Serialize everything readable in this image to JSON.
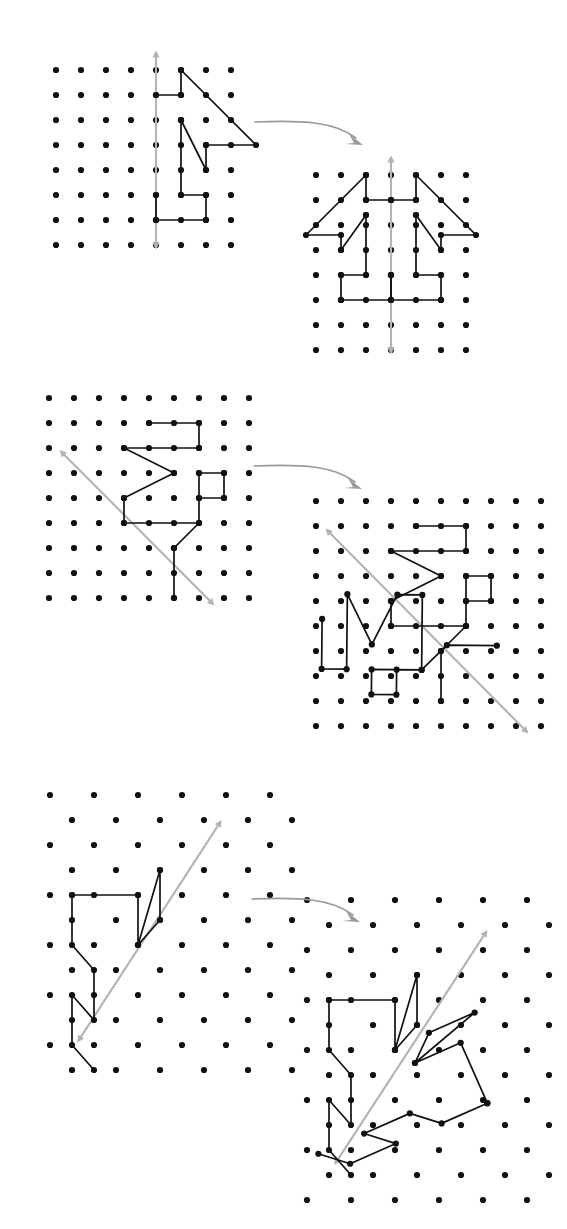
{
  "figure": {
    "background_color": "#ffffff",
    "dot_color": "#111111",
    "path_color": "#111111",
    "mirror_color": "#b3b3b3",
    "connector_color": "#9a9a9a",
    "dot_radius": 3.1,
    "vertex_radius": 3.1,
    "rows": [
      {
        "id": "row-1",
        "label": "Vertical mirror on a square lattice",
        "left": {
          "id": "panel-1-original",
          "lattice_type": "square",
          "cols": 8,
          "rows": 8,
          "spacing": 25,
          "origin": [
            56,
            70
          ],
          "mirror": {
            "type": "vertical",
            "from": [
              4,
              -0.75
            ],
            "to": [
              4,
              7.1
            ],
            "arrows": "both"
          },
          "path": [
            [
              4,
              0
            ],
            [
              5,
              0
            ],
            [
              5,
              1
            ],
            [
              4,
              1
            ],
            [
              5,
              1
            ],
            [
              5,
              0
            ],
            [
              8,
              3
            ],
            [
              6,
              3
            ],
            [
              6,
              4
            ],
            [
              5,
              4
            ],
            [
              5,
              2
            ],
            [
              5,
              5
            ],
            [
              6,
              5
            ],
            [
              6,
              6
            ],
            [
              4,
              6
            ],
            [
              4,
              5
            ],
            [
              5,
              5
            ],
            [
              5,
              4
            ]
          ],
          "path_segments": [
            [
              [
                4,
                1
              ],
              [
                5,
                1
              ],
              [
                5,
                0
              ],
              [
                8,
                3
              ],
              [
                6,
                3
              ],
              [
                6,
                4
              ],
              [
                5,
                2
              ]
            ],
            [
              [
                5,
                2
              ],
              [
                5,
                5
              ],
              [
                6,
                5
              ],
              [
                6,
                6
              ],
              [
                4,
                6
              ],
              [
                4,
                5
              ]
            ],
            [
              [
                5,
                0
              ],
              [
                5,
                1
              ]
            ]
          ]
        },
        "right": {
          "id": "panel-1-reflected",
          "lattice_type": "square",
          "cols": 7,
          "rows": 8,
          "spacing": 25,
          "origin": [
            316,
            175
          ],
          "mirror": {
            "type": "vertical",
            "from": [
              3,
              -0.75
            ],
            "to": [
              3,
              7.1
            ],
            "arrows": "both"
          }
        }
      },
      {
        "id": "row-2",
        "label": "Diagonal mirror on a square lattice",
        "left": {
          "id": "panel-2-original",
          "lattice_type": "square",
          "cols": 9,
          "rows": 9,
          "spacing": 25,
          "origin": [
            49,
            398
          ],
          "mirror": {
            "type": "diagonal",
            "from": [
              0.45,
              2.1
            ],
            "to": [
              6.6,
              8.3
            ],
            "arrows": "both"
          }
        },
        "right": {
          "id": "panel-2-reflected",
          "lattice_type": "square",
          "cols": 10,
          "rows": 10,
          "spacing": 25,
          "origin": [
            318,
            503
          ],
          "mirror": {
            "type": "diagonal",
            "from": [
              0.4,
              1.1
            ],
            "to": [
              8.5,
              9.3
            ],
            "arrows": "both"
          }
        }
      },
      {
        "id": "row-3",
        "label": "Diagonal mirror on a triangular lattice",
        "left": {
          "id": "panel-3-original",
          "lattice_type": "triangular",
          "cols": 6,
          "rows": 12,
          "spacing_x": 44,
          "spacing_y": 25,
          "origin": [
            53,
            795
          ],
          "mirror": {
            "type": "diagonal",
            "from": [
              0.95,
              9.7
            ],
            "to": [
              4.2,
              1.15
            ],
            "arrows": "both"
          }
        },
        "right": {
          "id": "panel-3-reflected",
          "lattice_type": "triangular",
          "cols": 7,
          "rows": 13,
          "spacing_x": 44,
          "spacing_y": 25,
          "origin": [
            310,
            900
          ],
          "mirror": {
            "type": "diagonal",
            "from": [
              0.95,
              10.4
            ],
            "to": [
              4.4,
              1.15
            ],
            "arrows": "both"
          }
        }
      }
    ],
    "connectors": [
      {
        "id": "connector-1",
        "from": [
          259,
          118
        ],
        "to": [
          364,
          135
        ]
      },
      {
        "id": "connector-2",
        "from": [
          258,
          462
        ],
        "to": [
          363,
          479
        ]
      },
      {
        "id": "connector-3",
        "from": [
          256,
          895
        ],
        "to": [
          361,
          912
        ]
      }
    ]
  },
  "chart_data": {
    "type": "diagram",
    "subtype": "lattice-reflection",
    "panels": [
      {
        "name": "row1-left",
        "lattice": "square-8x8",
        "mirror_axis": "vertical at column 4",
        "polyline_vertices": [
          [
            4,
            1
          ],
          [
            5,
            1
          ],
          [
            5,
            0
          ],
          [
            8,
            3
          ],
          [
            6,
            3
          ],
          [
            6,
            4
          ],
          [
            5,
            2
          ],
          [
            5,
            5
          ],
          [
            6,
            5
          ],
          [
            6,
            6
          ],
          [
            4,
            6
          ],
          [
            4,
            5
          ]
        ]
      },
      {
        "name": "row1-right",
        "lattice": "square-7x8",
        "mirror_axis": "vertical at column 3",
        "note": "original plus its mirror image"
      },
      {
        "name": "row2-left",
        "lattice": "square-9x9",
        "mirror_axis": "diagonal, down-right slope 1",
        "polyline_vertices": [
          [
            4,
            1
          ],
          [
            6,
            1
          ],
          [
            6,
            2
          ],
          [
            3,
            2
          ],
          [
            5,
            3
          ],
          [
            3,
            4
          ],
          [
            3,
            5
          ],
          [
            6,
            5
          ],
          [
            6,
            4
          ],
          [
            7,
            4
          ],
          [
            7,
            3
          ],
          [
            6,
            3
          ],
          [
            6,
            5
          ],
          [
            5,
            6
          ],
          [
            5,
            8
          ]
        ]
      },
      {
        "name": "row2-right",
        "lattice": "square-10x10",
        "mirror_axis": "diagonal, down-right slope 1",
        "note": "original plus its mirror image"
      },
      {
        "name": "row3-left",
        "lattice": "triangular",
        "mirror_axis": "diagonal, up-right",
        "note": "zig-zag polyline left of the axis"
      },
      {
        "name": "row3-right",
        "lattice": "triangular",
        "mirror_axis": "diagonal, up-right",
        "note": "original plus its mirror image"
      }
    ]
  }
}
